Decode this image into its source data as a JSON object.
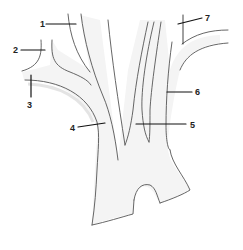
{
  "diagram": {
    "type": "anatomical line drawing of a branching vessel",
    "labels": [
      {
        "id": "1",
        "text": "1"
      },
      {
        "id": "2",
        "text": "2"
      },
      {
        "id": "3",
        "text": "3"
      },
      {
        "id": "4",
        "text": "4"
      },
      {
        "id": "5",
        "text": "5"
      },
      {
        "id": "6",
        "text": "6"
      },
      {
        "id": "7",
        "text": "7"
      }
    ]
  }
}
